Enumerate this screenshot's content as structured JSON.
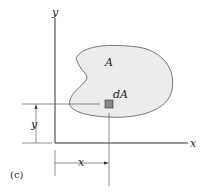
{
  "figure": {
    "caption": "(c)",
    "axis_x_label": "x",
    "axis_y_label": "y",
    "area_label": "A",
    "element_label": "dA",
    "dim_x_label": "x",
    "dim_y_label": "y",
    "colors": {
      "region_fill": "#ececec",
      "element_fill": "#888888",
      "line": "#333333"
    }
  }
}
